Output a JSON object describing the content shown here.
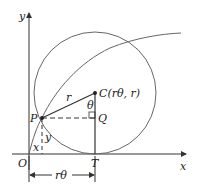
{
  "diagram": {
    "axes": {
      "x_label": "x",
      "y_label": "y",
      "origin_label": "O"
    },
    "points": {
      "P": "P",
      "Q": "Q",
      "C": "C(rθ, r)",
      "T": "T"
    },
    "segment_labels": {
      "radius": "r",
      "angle": "θ",
      "x": "x",
      "y": "y",
      "arc_length": "rθ"
    },
    "colors": {
      "line": "#333333",
      "curve": "#555555",
      "circle": "#555555"
    }
  }
}
